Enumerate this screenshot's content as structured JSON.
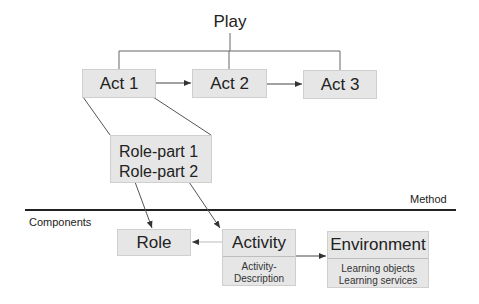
{
  "diagram": {
    "title": "Play",
    "acts": [
      {
        "label": "Act 1"
      },
      {
        "label": "Act 2"
      },
      {
        "label": "Act 3"
      }
    ],
    "role_parts": [
      "Role-part 1",
      "Role-part 2"
    ],
    "method_label": "Method",
    "components_label": "Components",
    "components": {
      "role": {
        "label": "Role"
      },
      "activity": {
        "label": "Activity",
        "details": [
          "Activity-",
          "Description"
        ]
      },
      "environment": {
        "label": "Environment",
        "details": [
          "Learning objects",
          "Learning services"
        ]
      }
    },
    "colors": {
      "box_fill": "#e6e6e6",
      "box_border": "#cfcfcf",
      "line": "#555555",
      "text": "#222222"
    }
  }
}
